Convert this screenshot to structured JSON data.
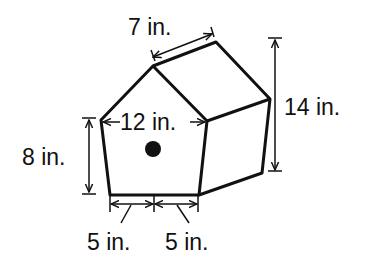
{
  "figure": {
    "type": "pentagonal prism birdhouse",
    "labels": {
      "depth": "7 in.",
      "total_height": "14 in.",
      "front_width": "12 in.",
      "wall_height": "8 in.",
      "base_left": "5 in.",
      "base_right": "5 in."
    }
  }
}
